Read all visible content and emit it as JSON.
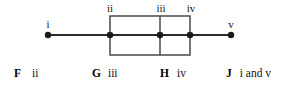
{
  "figure": {
    "type": "box-plot",
    "orientation": "horizontal",
    "axis": {
      "y": 35,
      "x_start": 48,
      "x_end": 231,
      "color": "#2b2b2b",
      "width": 2
    },
    "box": {
      "left": 110,
      "right": 190,
      "top": 16,
      "bottom": 55,
      "stroke": "#4a4a4a",
      "fill": "none",
      "stroke_width": 1.5
    },
    "median_line": {
      "x": 160,
      "top": 16,
      "bottom": 55,
      "stroke": "#4a4a4a",
      "stroke_width": 1.5
    },
    "points": [
      {
        "id": "i",
        "label": "i",
        "x": 48,
        "y": 35,
        "label_x": 48,
        "label_y": 19,
        "role": "minimum-whisker-end"
      },
      {
        "id": "ii",
        "label": "ii",
        "x": 110,
        "y": 35,
        "label_x": 110,
        "label_y": 3,
        "role": "lower-quartile"
      },
      {
        "id": "iii",
        "label": "iii",
        "x": 160,
        "y": 35,
        "label_x": 161,
        "label_y": 3,
        "role": "median"
      },
      {
        "id": "iv",
        "label": "iv",
        "x": 190,
        "y": 35,
        "label_x": 191,
        "label_y": 3,
        "role": "upper-quartile"
      },
      {
        "id": "v",
        "label": "v",
        "x": 231,
        "y": 35,
        "label_x": 231,
        "label_y": 19,
        "role": "maximum-whisker-end"
      }
    ],
    "point_marker": {
      "radius": 3.2,
      "fill": "#1a1a1a"
    }
  },
  "options": [
    {
      "letter": "F",
      "choice": "ii",
      "letter_x": 14,
      "choice_x": 34
    },
    {
      "letter": "G",
      "choice": "iii",
      "letter_x": 92,
      "choice_x": 108
    },
    {
      "letter": "H",
      "choice": "iv",
      "letter_x": 160,
      "choice_x": 177
    },
    {
      "letter": "J",
      "choice": "i and v",
      "letter_x": 226,
      "choice_x": 243
    }
  ],
  "colors": {
    "background": "#ffffff",
    "line": "#2b2b2b",
    "box_stroke": "#4a4a4a",
    "point_fill": "#1a1a1a",
    "text": "#111111"
  }
}
